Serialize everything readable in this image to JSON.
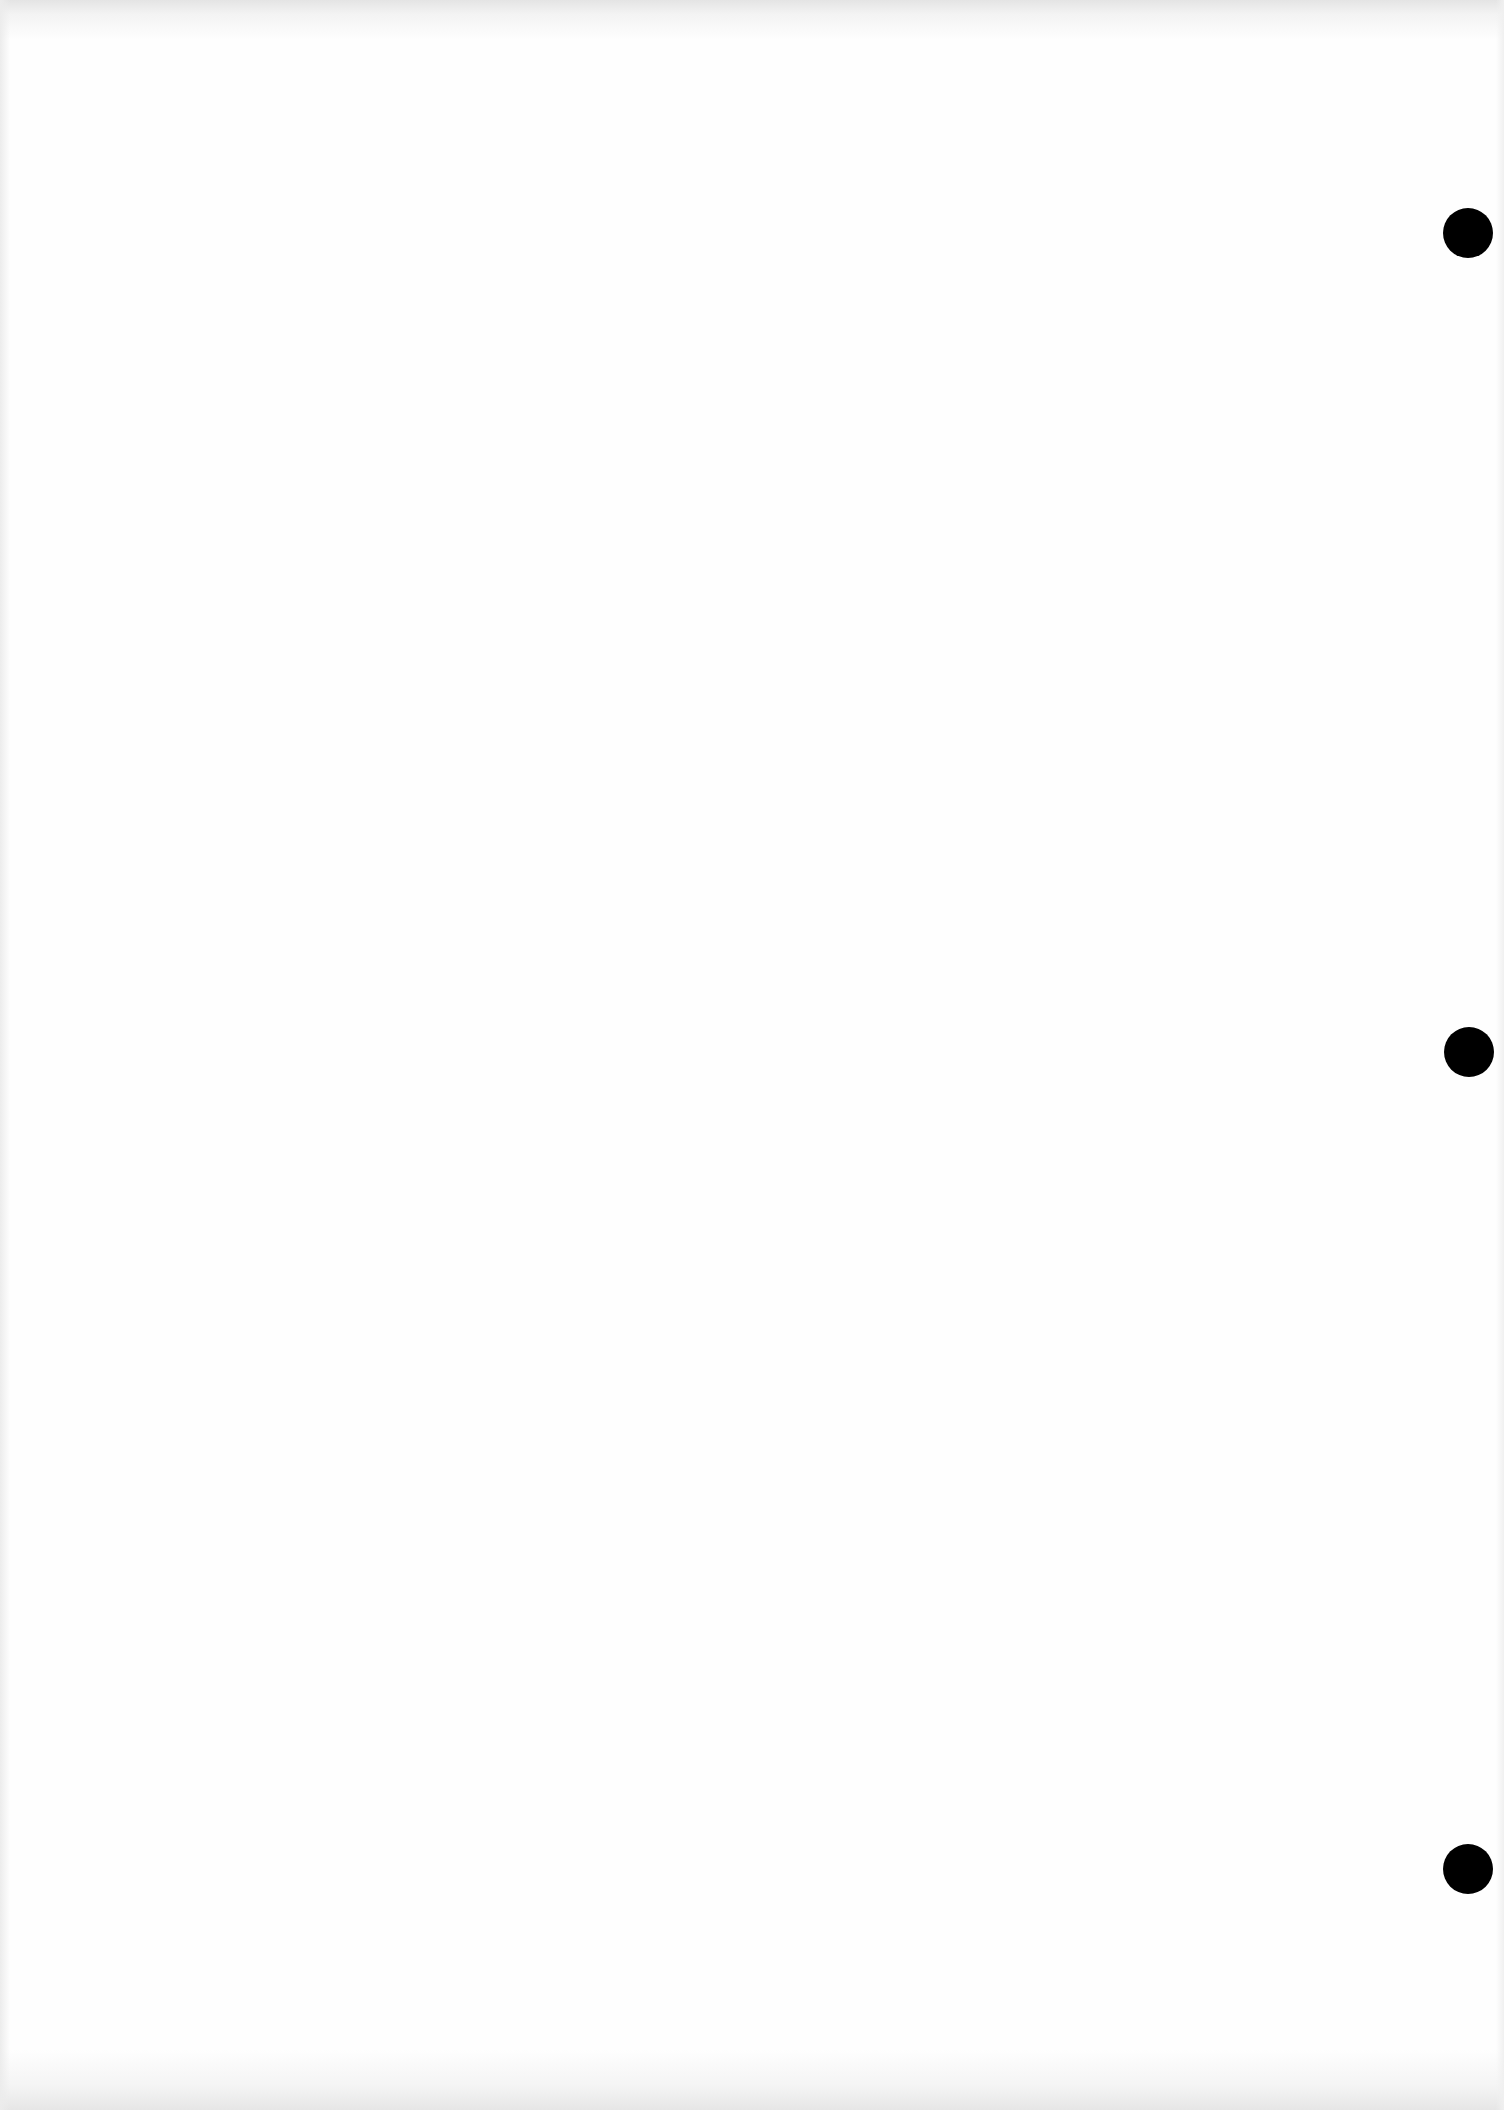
{
  "document": {
    "type": "blank scanned page",
    "background_color": "#fefefe",
    "punch_holes": [
      {
        "x": 1443,
        "y": 208,
        "diameter": 50,
        "color": "#000000"
      },
      {
        "x": 1444,
        "y": 1027,
        "diameter": 50,
        "color": "#000000"
      },
      {
        "x": 1443,
        "y": 1844,
        "diameter": 50,
        "color": "#000000"
      }
    ]
  }
}
